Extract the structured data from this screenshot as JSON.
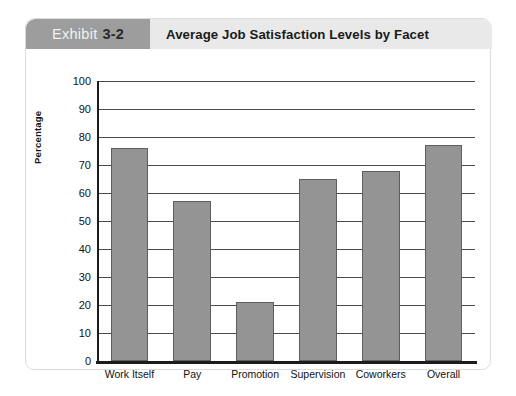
{
  "header": {
    "exhibit_word": "Exhibit",
    "exhibit_number": "3-2",
    "title": "Average Job Satisfaction Levels by Facet",
    "tab_color": "#9d9d9d",
    "strip_color": "#e9e9e9"
  },
  "chart_data": {
    "type": "bar",
    "title": "Average Job Satisfaction Levels by Facet",
    "xlabel": "",
    "ylabel": "Percentage",
    "categories": [
      "Work Itself",
      "Pay",
      "Promotion",
      "Supervision",
      "Coworkers",
      "Overall"
    ],
    "values": [
      76,
      57,
      21,
      65,
      68,
      77
    ],
    "ylim": [
      0,
      100
    ],
    "yticks": [
      0,
      10,
      20,
      30,
      40,
      50,
      60,
      70,
      80,
      90,
      100
    ],
    "ytick_labels": [
      "0",
      "10",
      "20",
      "30",
      "40",
      "50",
      "60",
      "70",
      "80",
      "90",
      "100"
    ],
    "grid": true,
    "legend": false,
    "bar_color": "#949494",
    "bar_border_color": "#5e5e5e",
    "axis_color": "#1c1c1c"
  }
}
